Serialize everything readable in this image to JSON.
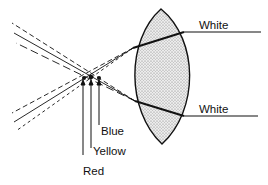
{
  "diagram": {
    "labels": {
      "white_top": "White",
      "white_bottom": "White",
      "blue": "Blue",
      "yellow": "Yellow",
      "red": "Red"
    },
    "colors": {
      "ink": "#111111",
      "lens_fill": "#d9d9d9",
      "background": "#ffffff"
    },
    "components": [
      "lens",
      "incoming white rays",
      "refracted red/yellow/blue rays",
      "focal points"
    ]
  }
}
